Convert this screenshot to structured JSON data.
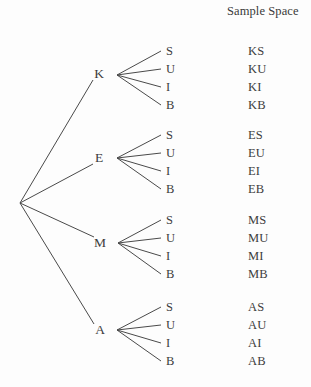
{
  "header": {
    "sample_space_label": "Sample Space"
  },
  "tree": {
    "root": {
      "x": 20,
      "y": 203
    },
    "branch_labels": [
      "S",
      "U",
      "I",
      "B"
    ],
    "groups": [
      {
        "node_label": "K",
        "node_x": 99,
        "node_y": 74,
        "fan_x": 117,
        "fan_y": 75,
        "leaves": [
          {
            "label": "S",
            "outcome": "KS",
            "y": 45
          },
          {
            "label": "U",
            "outcome": "KU",
            "y": 63
          },
          {
            "label": "I",
            "outcome": "KI",
            "y": 81
          },
          {
            "label": "B",
            "outcome": "KB",
            "y": 99
          }
        ]
      },
      {
        "node_label": "E",
        "node_x": 99,
        "node_y": 158,
        "fan_x": 117,
        "fan_y": 158,
        "leaves": [
          {
            "label": "S",
            "outcome": "ES",
            "y": 129
          },
          {
            "label": "U",
            "outcome": "EU",
            "y": 147
          },
          {
            "label": "I",
            "outcome": "EI",
            "y": 165
          },
          {
            "label": "B",
            "outcome": "EB",
            "y": 183
          }
        ]
      },
      {
        "node_label": "M",
        "node_x": 100,
        "node_y": 243,
        "fan_x": 118,
        "fan_y": 243,
        "leaves": [
          {
            "label": "S",
            "outcome": "MS",
            "y": 214
          },
          {
            "label": "U",
            "outcome": "MU",
            "y": 232
          },
          {
            "label": "I",
            "outcome": "MI",
            "y": 250
          },
          {
            "label": "B",
            "outcome": "MB",
            "y": 268
          }
        ]
      },
      {
        "node_label": "A",
        "node_x": 100,
        "node_y": 330,
        "fan_x": 117,
        "fan_y": 330,
        "leaves": [
          {
            "label": "S",
            "outcome": "AS",
            "y": 301
          },
          {
            "label": "U",
            "outcome": "AU",
            "y": 319
          },
          {
            "label": "I",
            "outcome": "AI",
            "y": 337
          },
          {
            "label": "B",
            "outcome": "AB",
            "y": 355
          }
        ]
      }
    ],
    "leaf_label_x": 166,
    "outcome_x": 248,
    "line_color": "#4a4a4a"
  },
  "chart_data": {
    "type": "diagram",
    "diagram_kind": "probability-tree",
    "title": "",
    "column_headers": [
      "",
      "Sample Space"
    ],
    "level1_outcomes": [
      "K",
      "E",
      "M",
      "A"
    ],
    "level2_outcomes": [
      "S",
      "U",
      "I",
      "B"
    ],
    "sample_space": [
      "KS",
      "KU",
      "KI",
      "KB",
      "ES",
      "EU",
      "EI",
      "EB",
      "MS",
      "MU",
      "MI",
      "MB",
      "AS",
      "AU",
      "AI",
      "AB"
    ],
    "total_outcomes": 16
  }
}
